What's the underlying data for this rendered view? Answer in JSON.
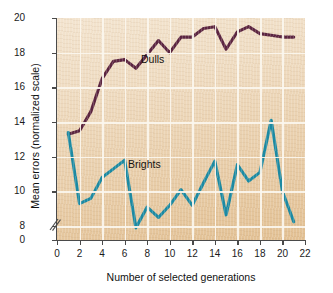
{
  "chart_data": {
    "type": "line",
    "title": "",
    "xlabel": "Number of selected generations",
    "ylabel": "Mean errors (normalized scale)",
    "xlim": [
      0,
      22
    ],
    "ylim": [
      7.2,
      20
    ],
    "y_axis_break": true,
    "y_break_symbol": "//",
    "grid": true,
    "legend_position": "inline-annotation",
    "xticks": [
      0,
      2,
      4,
      6,
      8,
      10,
      12,
      14,
      16,
      18,
      20,
      22
    ],
    "xtick_labels": [
      "0",
      "2",
      "4",
      "6",
      "8",
      "10",
      "12",
      "14",
      "16",
      "18",
      "20",
      "22"
    ],
    "yticks": [
      0,
      8,
      10,
      12,
      14,
      16,
      18,
      20
    ],
    "ytick_labels": [
      "0",
      "8",
      "10",
      "12",
      "14",
      "16",
      "18",
      "20"
    ],
    "series": [
      {
        "name": "Dulls",
        "color": "#5b2440",
        "x": [
          1,
          2,
          3,
          4,
          5,
          6,
          7,
          8,
          9,
          10,
          11,
          12,
          13,
          14,
          15,
          16,
          17,
          18,
          19,
          20,
          21
        ],
        "values": [
          13.3,
          13.5,
          14.6,
          16.5,
          17.5,
          17.6,
          17.1,
          17.9,
          18.7,
          18.0,
          18.9,
          18.9,
          19.4,
          19.5,
          18.2,
          19.2,
          19.5,
          19.1,
          19.0,
          18.9,
          18.9
        ]
      },
      {
        "name": "Brights",
        "color": "#1b8aa3",
        "x": [
          1,
          2,
          3,
          4,
          5,
          6,
          7,
          8,
          9,
          10,
          11,
          12,
          13,
          14,
          15,
          16,
          17,
          18,
          19,
          20,
          21
        ],
        "values": [
          13.4,
          9.3,
          9.6,
          10.8,
          11.3,
          11.8,
          7.9,
          9.1,
          8.5,
          9.2,
          10.1,
          9.2,
          10.5,
          11.75,
          8.65,
          11.55,
          10.6,
          11.1,
          14.1,
          10.0,
          8.25
        ]
      }
    ],
    "annotations": [
      {
        "text": "Dulls",
        "x": 9.4,
        "y": 17.3
      },
      {
        "text": "Brights",
        "x": 8.1,
        "y": 10.9
      }
    ]
  },
  "style": {
    "plot_background_top": "#f3e4cf",
    "plot_background_bottom": "#e2c093",
    "gridline_color": "#fbf6ee",
    "axis_color": "#4a4a4a",
    "text_color": "#111111"
  }
}
